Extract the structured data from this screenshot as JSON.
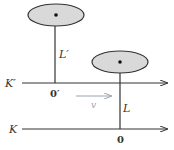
{
  "diagram": {
    "frames": [
      {
        "id": "K_prime",
        "label": "K′",
        "origin_label": "0′",
        "axis_y": 83
      },
      {
        "id": "K",
        "label": "K",
        "origin_label": "0",
        "axis_y": 129
      }
    ],
    "clocks": [
      {
        "id": "clock_L_prime",
        "rod_label": "L′",
        "center": [
          56,
          15
        ],
        "rod_bottom_y": 83,
        "rod_x": 55
      },
      {
        "id": "clock_L",
        "rod_label": "L",
        "center": [
          120,
          62
        ],
        "rod_bottom_y": 129,
        "rod_x": 120
      }
    ],
    "velocity": {
      "label": "v",
      "arrow_from_x": 76,
      "arrow_to_x": 111,
      "y": 96
    },
    "colors": {
      "line": "#333333",
      "disk_fill": "#d9d9d9",
      "velocity_arrow": "#9aa3ad"
    }
  },
  "labels": {
    "K_prime": "K′",
    "origin_prime": "0′",
    "L_prime": "L′",
    "L": "L",
    "K": "K",
    "origin": "0",
    "v": "v"
  }
}
